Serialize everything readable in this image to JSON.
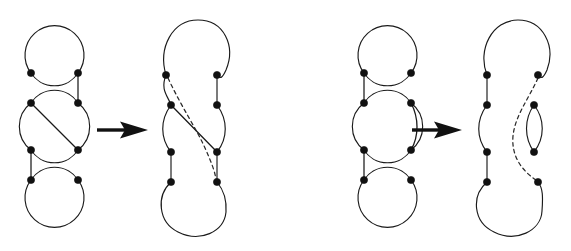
{
  "figure": {
    "background_color": "#ffffff",
    "stroke_color": "#1a1a1a",
    "node_color": "#111111",
    "width": 571,
    "height": 251,
    "panel_count": 2,
    "panels": [
      {
        "id": "panel-left",
        "name": "diagonal-chord-move",
        "before": {
          "id": "left-before",
          "description": "Vertical stack of three circles joined by short vertical connectors; middle circle carries a diagonal chord from its top-left node to its bottom-right node.",
          "circle_count": 3,
          "node_count": 6,
          "chord_count": 1,
          "chord_style": "solid-straight-diagonal",
          "connector_count": 2,
          "circles": [
            {
              "name": "top-circle",
              "cx": 54.5,
              "cy": 50,
              "r": 29.5
            },
            {
              "name": "middle-circle",
              "cx": 54.5,
              "cy": 126,
              "r": 29.5
            },
            {
              "name": "bottom-circle",
              "cx": 54.5,
              "cy": 203,
              "r": 29.5
            }
          ],
          "nodes": [
            {
              "name": "node-top-left",
              "x": 31,
              "y": 73
            },
            {
              "name": "node-top-right",
              "x": 78,
              "y": 73
            },
            {
              "name": "node-mid-upper-left",
              "x": 31,
              "y": 103
            },
            {
              "name": "node-mid-upper-right",
              "x": 78,
              "y": 103
            },
            {
              "name": "node-mid-lower-left",
              "x": 31,
              "y": 150
            },
            {
              "name": "node-mid-lower-right",
              "x": 78,
              "y": 150
            },
            {
              "name": "node-bottom-left",
              "x": 31,
              "y": 180
            },
            {
              "name": "node-bottom-right",
              "x": 78,
              "y": 180
            }
          ]
        },
        "arrow": {
          "name": "transform-arrow-left",
          "x1": 97,
          "x2": 148,
          "y": 130,
          "direction": "right"
        },
        "after": {
          "id": "left-after",
          "description": "Resolved diagram: the circles merge into one long smoothed loop; the diagonal chord becomes a crossing strand and a long dashed strand sweeps from the upper-left node down to the lower-right node.",
          "node_count": 8,
          "solid_chord_count": 1,
          "dashed_strand_count": 1,
          "chord_style": "solid-crossing-plus-long-dashed"
        }
      },
      {
        "id": "panel-right",
        "name": "parallel-chord-move",
        "before": {
          "id": "right-before",
          "description": "Vertical stack of three circles joined by short vertical connectors; middle circle carries a short arc chord bulging right, joining its top-right node to its bottom-right node.",
          "circle_count": 3,
          "node_count": 6,
          "chord_count": 1,
          "chord_style": "solid-curved-right-arc",
          "connector_count": 2,
          "circles": [
            {
              "name": "top-circle",
              "cx": 388,
              "cy": 50,
              "r": 29.5
            },
            {
              "name": "middle-circle",
              "cx": 388,
              "cy": 126,
              "r": 29.5
            },
            {
              "name": "bottom-circle",
              "cx": 388,
              "cy": 203,
              "r": 29.5
            }
          ]
        },
        "arrow": {
          "name": "transform-arrow-right",
          "x1": 412,
          "x2": 462,
          "y": 130,
          "direction": "right"
        },
        "after": {
          "id": "right-after",
          "description": "Resolved diagram: one long smoothed loop on the left, a small detached lens (bigon) on the right, and a long dashed strand sweeping from the upper-right node down to the lower-right node.",
          "node_count": 8,
          "lens_count": 1,
          "dashed_strand_count": 1,
          "chord_style": "detached-lens-plus-long-dashed"
        }
      }
    ],
    "labels": []
  }
}
